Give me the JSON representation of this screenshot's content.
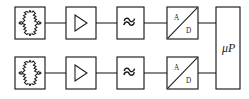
{
  "diagram": {
    "type": "block-diagram",
    "colors": {
      "stroke": "#1a1a1a",
      "background": "#ffffff"
    },
    "channels": [
      {
        "id": "channel-1",
        "row": "top",
        "stages": [
          {
            "id": "bridge-1",
            "icon": "wheatstone-bridge-icon",
            "label": ""
          },
          {
            "id": "amplifier-1",
            "icon": "amplifier-triangle-icon",
            "label": ""
          },
          {
            "id": "filter-1",
            "icon": "filter-wave-icon",
            "label": ""
          },
          {
            "id": "adc-1",
            "icon": "ad-converter-icon",
            "label_a": "A",
            "label_d": "D"
          }
        ]
      },
      {
        "id": "channel-2",
        "row": "bottom",
        "stages": [
          {
            "id": "bridge-2",
            "icon": "wheatstone-bridge-icon",
            "label": ""
          },
          {
            "id": "amplifier-2",
            "icon": "amplifier-triangle-icon",
            "label": ""
          },
          {
            "id": "filter-2",
            "icon": "filter-wave-icon",
            "label": ""
          },
          {
            "id": "adc-2",
            "icon": "ad-converter-icon",
            "label_a": "A",
            "label_d": "D"
          }
        ]
      }
    ],
    "processor": {
      "id": "microprocessor",
      "label": "μP"
    },
    "adc_labels": {
      "analog": "A",
      "digital": "D"
    }
  }
}
